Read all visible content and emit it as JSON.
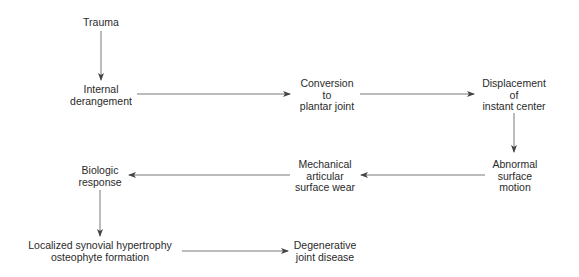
{
  "diagram": {
    "nodes": [
      {
        "id": "trauma",
        "lines": [
          "Trauma"
        ]
      },
      {
        "id": "internal-derangement",
        "lines": [
          "Internal",
          "derangement"
        ]
      },
      {
        "id": "conversion",
        "lines": [
          "Conversion",
          "to",
          "plantar joint"
        ]
      },
      {
        "id": "displacement",
        "lines": [
          "Displacement",
          "of",
          "instant center"
        ]
      },
      {
        "id": "abnormal-motion",
        "lines": [
          "Abnormal",
          "surface",
          "motion"
        ]
      },
      {
        "id": "mechanical-wear",
        "lines": [
          "Mechanical",
          "articular",
          "surface wear"
        ]
      },
      {
        "id": "biologic-response",
        "lines": [
          "Biologic",
          "response"
        ]
      },
      {
        "id": "synovial-hypertrophy",
        "lines": [
          "Localized synovial hypertrophy",
          "osteophyte formation"
        ]
      },
      {
        "id": "degenerative-disease",
        "lines": [
          "Degenerative",
          "joint disease"
        ]
      }
    ],
    "edges": [
      {
        "from": "trauma",
        "to": "internal-derangement"
      },
      {
        "from": "internal-derangement",
        "to": "conversion"
      },
      {
        "from": "conversion",
        "to": "displacement"
      },
      {
        "from": "displacement",
        "to": "abnormal-motion"
      },
      {
        "from": "abnormal-motion",
        "to": "mechanical-wear"
      },
      {
        "from": "mechanical-wear",
        "to": "biologic-response"
      },
      {
        "from": "biologic-response",
        "to": "synovial-hypertrophy"
      },
      {
        "from": "synovial-hypertrophy",
        "to": "degenerative-disease"
      }
    ],
    "line_color": "#555555"
  }
}
